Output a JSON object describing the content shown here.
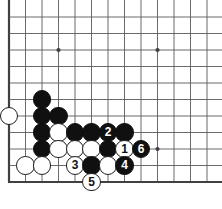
{
  "app": {
    "title": "Go Board Diagram",
    "type": "go-game-diagram"
  },
  "board": {
    "background_color": "#ffffff",
    "line_color": "#5a5a5a",
    "border_color": "#404040",
    "black_stone_color": "#101010",
    "white_stone_color": "#ffffff",
    "stone_radius": 9.2,
    "grid_spacing": 16.5,
    "origin_x": 9,
    "origin_y": 17,
    "cols": 13,
    "rows": 11,
    "left_edge_col": 0,
    "bottom_edge_row": 10,
    "star_points": [
      {
        "col": 3,
        "row": 2
      },
      {
        "col": 9,
        "row": 2
      },
      {
        "col": 9,
        "row": 8
      }
    ]
  },
  "stones": [
    {
      "name": "white-stone-a",
      "col": 0,
      "row": 6,
      "color": "white",
      "label": ""
    },
    {
      "name": "black-stone-b",
      "col": 2,
      "row": 5,
      "color": "black",
      "label": ""
    },
    {
      "name": "black-stone-c",
      "col": 2,
      "row": 6,
      "color": "black",
      "label": ""
    },
    {
      "name": "black-stone-d",
      "col": 3,
      "row": 6,
      "color": "black",
      "label": ""
    },
    {
      "name": "black-stone-e",
      "col": 2,
      "row": 7,
      "color": "black",
      "label": ""
    },
    {
      "name": "white-stone-f",
      "col": 3,
      "row": 7,
      "color": "white",
      "label": ""
    },
    {
      "name": "black-stone-g",
      "col": 4,
      "row": 7,
      "color": "black",
      "label": ""
    },
    {
      "name": "black-stone-h",
      "col": 5,
      "row": 7,
      "color": "black",
      "label": ""
    },
    {
      "name": "black-move-2",
      "col": 6,
      "row": 7,
      "color": "black",
      "label": "2"
    },
    {
      "name": "black-stone-i",
      "col": 7,
      "row": 7,
      "color": "black",
      "label": ""
    },
    {
      "name": "black-stone-j",
      "col": 2,
      "row": 8,
      "color": "black",
      "label": ""
    },
    {
      "name": "white-stone-k",
      "col": 3,
      "row": 8,
      "color": "white",
      "label": ""
    },
    {
      "name": "white-stone-l",
      "col": 4,
      "row": 8,
      "color": "white",
      "label": ""
    },
    {
      "name": "white-stone-m",
      "col": 5,
      "row": 8,
      "color": "white",
      "label": ""
    },
    {
      "name": "black-stone-n",
      "col": 6,
      "row": 8,
      "color": "black",
      "label": ""
    },
    {
      "name": "white-move-1",
      "col": 7,
      "row": 8,
      "color": "white",
      "label": "1"
    },
    {
      "name": "black-move-6",
      "col": 8,
      "row": 8,
      "color": "black",
      "label": "6"
    },
    {
      "name": "white-stone-o",
      "col": 1,
      "row": 9,
      "color": "white",
      "label": ""
    },
    {
      "name": "white-stone-p",
      "col": 2,
      "row": 9,
      "color": "white",
      "label": ""
    },
    {
      "name": "white-move-3",
      "col": 4,
      "row": 9,
      "color": "white",
      "label": "3"
    },
    {
      "name": "black-stone-q",
      "col": 5,
      "row": 9,
      "color": "black",
      "label": ""
    },
    {
      "name": "white-stone-r",
      "col": 6,
      "row": 9,
      "color": "white",
      "label": ""
    },
    {
      "name": "black-move-4",
      "col": 7,
      "row": 9,
      "color": "black",
      "label": "4"
    },
    {
      "name": "white-move-5",
      "col": 5,
      "row": 10,
      "color": "white",
      "label": "5"
    }
  ],
  "move_sequence": [
    {
      "number": "1",
      "color": "white"
    },
    {
      "number": "2",
      "color": "black"
    },
    {
      "number": "3",
      "color": "white"
    },
    {
      "number": "4",
      "color": "black"
    },
    {
      "number": "5",
      "color": "white"
    },
    {
      "number": "6",
      "color": "black"
    }
  ]
}
